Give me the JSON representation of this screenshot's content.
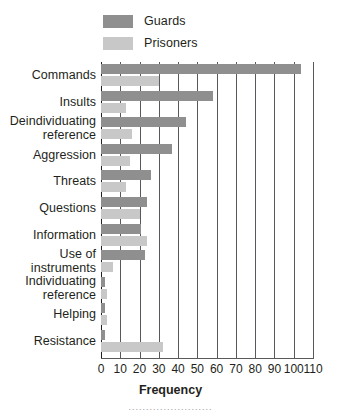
{
  "chart_data": {
    "type": "bar",
    "orientation": "horizontal",
    "title": "",
    "xlabel": "Frequency",
    "ylabel": "",
    "xlim": [
      0,
      110
    ],
    "xticks": [
      0,
      10,
      20,
      30,
      40,
      50,
      60,
      70,
      80,
      90,
      100,
      110
    ],
    "grid": true,
    "legend_position": "top",
    "categories": [
      "Commands",
      "Insults",
      "Deindividuating reference",
      "Aggression",
      "Threats",
      "Questions",
      "Information",
      "Use of instruments",
      "Individuating reference",
      "Helping",
      "Resistance"
    ],
    "series": [
      {
        "name": "Guards",
        "color": "#8f8f8f",
        "values": [
          104,
          58,
          44,
          37,
          26,
          24,
          21,
          23,
          2,
          2,
          2
        ]
      },
      {
        "name": "Prisoners",
        "color": "#c8c8c8",
        "values": [
          30,
          13,
          16,
          15,
          13,
          20,
          24,
          6,
          3,
          3,
          32
        ]
      }
    ]
  },
  "legend": {
    "items": [
      {
        "label": "Guards",
        "color": "#8f8f8f"
      },
      {
        "label": "Prisoners",
        "color": "#c8c8c8"
      }
    ]
  },
  "axis": {
    "x_title": "Frequency",
    "tick_labels": [
      "0",
      "10",
      "20",
      "30",
      "40",
      "50",
      "60",
      "70",
      "80",
      "90",
      "100",
      "110"
    ]
  },
  "footer": {
    "dotted_rule": "........................"
  }
}
